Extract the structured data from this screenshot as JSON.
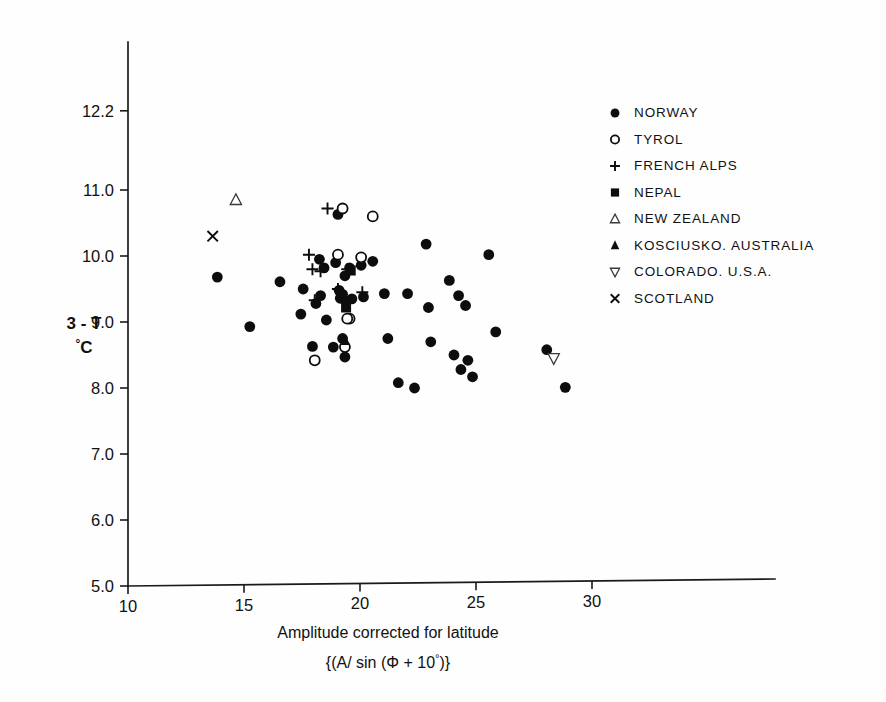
{
  "chart_data": {
    "type": "scatter",
    "title": "",
    "xlabel": "Amplitude corrected for latitude",
    "xlabel_line2": "{(A/ sin (Φ + 10°)}",
    "ylabel_line1": "3 - T",
    "ylabel_line2": "°C",
    "xlim": [
      10,
      32.5
    ],
    "ylim": [
      5.0,
      12.8
    ],
    "xticks": [
      10,
      15,
      20,
      25,
      30
    ],
    "xtick_labels": [
      "10",
      "15",
      "20",
      "25",
      "30"
    ],
    "yticks": [
      5.0,
      6.0,
      7.0,
      8.0,
      9.0,
      10.0,
      11.0,
      12.2
    ],
    "ytick_labels": [
      "5.0",
      "6.0",
      "7.0",
      "8.0",
      "9.0",
      "10.0",
      "11.0",
      "12.2"
    ],
    "grid": false,
    "legend_position": "upper-right",
    "series": [
      {
        "name": "NORWAY",
        "marker": "filled-circle",
        "points": [
          [
            13.85,
            9.68
          ],
          [
            15.25,
            8.93
          ],
          [
            16.55,
            9.61
          ],
          [
            17.45,
            9.12
          ],
          [
            17.55,
            9.5
          ],
          [
            18.25,
            9.95
          ],
          [
            18.45,
            9.82
          ],
          [
            18.55,
            9.03
          ],
          [
            18.3,
            9.4
          ],
          [
            18.1,
            9.28
          ],
          [
            17.95,
            8.63
          ],
          [
            18.95,
            9.9
          ],
          [
            19.05,
            10.63
          ],
          [
            19.1,
            9.48
          ],
          [
            19.15,
            9.36
          ],
          [
            19.35,
            9.7
          ],
          [
            19.25,
            9.42
          ],
          [
            19.4,
            9.3
          ],
          [
            19.55,
            9.82
          ],
          [
            19.65,
            9.35
          ],
          [
            18.85,
            8.62
          ],
          [
            19.25,
            8.75
          ],
          [
            19.35,
            8.47
          ],
          [
            20.05,
            9.86
          ],
          [
            20.15,
            9.38
          ],
          [
            20.55,
            9.92
          ],
          [
            21.05,
            9.43
          ],
          [
            21.2,
            8.75
          ],
          [
            21.65,
            8.08
          ],
          [
            22.05,
            9.43
          ],
          [
            22.35,
            8.0
          ],
          [
            22.85,
            10.18
          ],
          [
            22.95,
            9.22
          ],
          [
            23.05,
            8.7
          ],
          [
            23.85,
            9.63
          ],
          [
            24.05,
            8.5
          ],
          [
            24.25,
            9.4
          ],
          [
            24.35,
            8.28
          ],
          [
            24.55,
            9.25
          ],
          [
            24.65,
            8.42
          ],
          [
            24.85,
            8.17
          ],
          [
            25.55,
            10.02
          ],
          [
            25.85,
            8.85
          ],
          [
            28.05,
            8.58
          ],
          [
            28.85,
            8.01
          ]
        ]
      },
      {
        "name": "TYROL",
        "marker": "open-circle",
        "points": [
          [
            19.25,
            10.72
          ],
          [
            20.55,
            10.6
          ],
          [
            19.05,
            10.02
          ],
          [
            20.05,
            9.98
          ],
          [
            19.55,
            9.05
          ],
          [
            18.05,
            8.42
          ],
          [
            19.35,
            8.62
          ],
          [
            19.45,
            9.05
          ]
        ]
      },
      {
        "name": "FRENCH ALPS",
        "marker": "plus",
        "points": [
          [
            18.6,
            10.72
          ],
          [
            17.8,
            10.02
          ],
          [
            17.95,
            9.8
          ],
          [
            18.3,
            9.77
          ],
          [
            19.45,
            9.8
          ],
          [
            18.05,
            9.33
          ],
          [
            19.05,
            9.5
          ],
          [
            20.1,
            9.45
          ]
        ]
      },
      {
        "name": "NEPAL",
        "marker": "filled-square",
        "points": [
          [
            19.6,
            9.78
          ],
          [
            19.4,
            9.22
          ]
        ]
      },
      {
        "name": "NEW ZEALAND",
        "marker": "open-triangle",
        "points": [
          [
            14.65,
            10.85
          ]
        ]
      },
      {
        "name": "KOSCIUSKO. AUSTRALIA",
        "marker": "filled-triangle",
        "points": [
          [
            19.35,
            8.72
          ]
        ]
      },
      {
        "name": "COLORADO. U.S.A.",
        "marker": "open-dtriangle",
        "points": [
          [
            28.35,
            8.45
          ]
        ]
      },
      {
        "name": "SCOTLAND",
        "marker": "cross",
        "points": [
          [
            13.65,
            10.3
          ]
        ]
      }
    ]
  },
  "legend": {
    "items": [
      {
        "label": "NORWAY",
        "marker": "filled-circle"
      },
      {
        "label": "TYROL",
        "marker": "open-circle"
      },
      {
        "label": "FRENCH ALPS",
        "marker": "plus"
      },
      {
        "label": "NEPAL",
        "marker": "filled-square"
      },
      {
        "label": "NEW ZEALAND",
        "marker": "open-triangle"
      },
      {
        "label": "KOSCIUSKO. AUSTRALIA",
        "marker": "filled-triangle"
      },
      {
        "label": "COLORADO. U.S.A.",
        "marker": "open-dtriangle"
      },
      {
        "label": "SCOTLAND",
        "marker": "cross"
      }
    ]
  },
  "colors": {
    "ink": "#0d0d0d",
    "background": "#ffffff"
  }
}
